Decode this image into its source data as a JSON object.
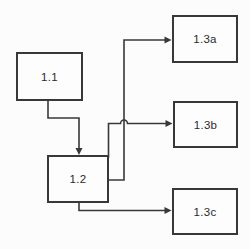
{
  "diagram": {
    "title": "",
    "nodes": [
      {
        "id": "1.1",
        "label": "1.1"
      },
      {
        "id": "1.2",
        "label": "1.2"
      },
      {
        "id": "1.3a",
        "label": "1.3a"
      },
      {
        "id": "1.3b",
        "label": "1.3b"
      },
      {
        "id": "1.3c",
        "label": "1.3c"
      }
    ],
    "edges": [
      {
        "from": "1.1",
        "to": "1.2",
        "style": "elbow-arrow"
      },
      {
        "from": "1.2",
        "to": "1.3a",
        "style": "elbow-arrow"
      },
      {
        "from": "1.2",
        "to": "1.3b",
        "style": "elbow-arrow-with-hop"
      },
      {
        "from": "1.2",
        "to": "1.3c",
        "style": "elbow-arrow"
      }
    ],
    "colors": {
      "line": "#383838",
      "box_border": "#383838",
      "box_fill": "#fdfdfd",
      "background": "#fcfcfc",
      "text": "#2a2a2a"
    }
  }
}
